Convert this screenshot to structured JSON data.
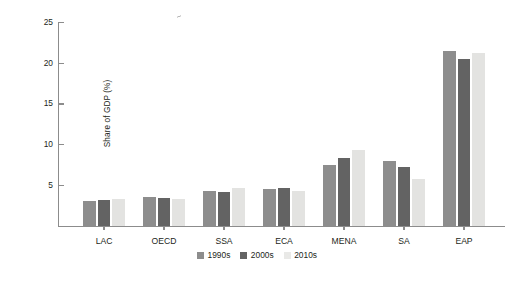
{
  "chart_data": {
    "type": "bar",
    "title": "",
    "xlabel": "",
    "ylabel": "Share of GDP (%)",
    "ylim": [
      0,
      25
    ],
    "yticks": [
      0,
      5,
      10,
      15,
      20,
      25
    ],
    "ytick_labels": [
      "",
      "5",
      "10",
      "15",
      "20",
      "25"
    ],
    "grid": false,
    "legend_position": "bottom-center",
    "categories": [
      "LAC",
      "OECD",
      "SSA",
      "ECA",
      "MENA",
      "SA",
      "EAP"
    ],
    "series": [
      {
        "name": "1990s",
        "color": "#8d8d8d",
        "values": [
          3.0,
          3.5,
          4.2,
          4.5,
          7.5,
          7.9,
          21.5
        ]
      },
      {
        "name": "2000s",
        "color": "#636363",
        "values": [
          3.2,
          3.4,
          4.1,
          4.6,
          8.3,
          7.2,
          20.5
        ]
      },
      {
        "name": "2010s",
        "color": "#e3e3e1",
        "values": [
          3.3,
          3.3,
          4.6,
          4.3,
          9.3,
          5.7,
          21.2
        ]
      }
    ]
  },
  "axis": {
    "y_title": "Share of GDP (%)",
    "tick_25": "25",
    "tick_20": "20",
    "tick_15": "15",
    "tick_10": "10",
    "tick_5": "5"
  },
  "categories": {
    "c0": "LAC",
    "c1": "OECD",
    "c2": "SSA",
    "c3": "ECA",
    "c4": "MENA",
    "c5": "SA",
    "c6": "EAP"
  },
  "legend": {
    "i0": "1990s",
    "i1": "2000s",
    "i2": "2010s"
  }
}
